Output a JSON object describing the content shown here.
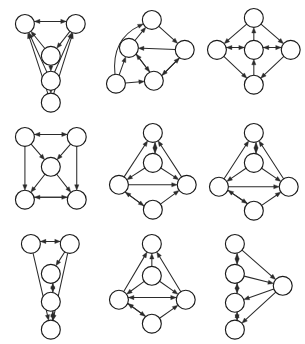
{
  "figure": {
    "panel_count": 9,
    "grid": {
      "rows": 3,
      "cols": 3
    },
    "node_count_per_panel": 5,
    "background_color": "#ffffff",
    "node_fill_color": "#ffffff",
    "node_stroke_color": "#1a1a1a",
    "edge_color": "#2b2b2b",
    "node_radius": 9.5,
    "arrowhead_length": 5.5,
    "arrowhead_width": 4.2
  },
  "panels": [
    {
      "id": "panel-1",
      "name": "wide-top-triangle-chain",
      "viewbox": [
        0,
        0,
        102,
        115
      ],
      "nodes": [
        {
          "id": "n0",
          "x": 25,
          "y": 24
        },
        {
          "id": "n1",
          "x": 76,
          "y": 24
        },
        {
          "id": "n2",
          "x": 51,
          "y": 56
        },
        {
          "id": "n3",
          "x": 51,
          "y": 81
        },
        {
          "id": "n4",
          "x": 51,
          "y": 103
        }
      ],
      "edges": [
        {
          "from": "n0",
          "to": "n1",
          "offset": -2.5
        },
        {
          "from": "n1",
          "to": "n0",
          "offset": 2.5
        },
        {
          "from": "n1",
          "to": "n2",
          "offset": 0
        },
        {
          "from": "n2",
          "to": "n0",
          "offset": 0
        },
        {
          "from": "n2",
          "to": "n3",
          "offset": 0
        },
        {
          "from": "n3",
          "to": "n0",
          "offset": 0
        },
        {
          "from": "n3",
          "to": "n1",
          "offset": 0
        },
        {
          "from": "n3",
          "to": "n4",
          "offset": 0
        },
        {
          "from": "n4",
          "to": "n0",
          "offset": 0
        },
        {
          "from": "n4",
          "to": "n1",
          "offset": 0
        }
      ]
    },
    {
      "id": "panel-2",
      "name": "curved-left-loop-cluster",
      "viewbox": [
        0,
        0,
        102,
        115
      ],
      "nodes": [
        {
          "id": "n0",
          "x": 50,
          "y": 20
        },
        {
          "id": "n1",
          "x": 27,
          "y": 48
        },
        {
          "id": "n2",
          "x": 83,
          "y": 50
        },
        {
          "id": "n3",
          "x": 14,
          "y": 84
        },
        {
          "id": "n4",
          "x": 52,
          "y": 81
        }
      ],
      "edges": [
        {
          "from": "n0",
          "to": "n2",
          "offset": 0
        },
        {
          "from": "n1",
          "to": "n0",
          "offset": 0
        },
        {
          "from": "n2",
          "to": "n1",
          "offset": 0
        },
        {
          "from": "n1",
          "to": "n4",
          "offset": -2.0
        },
        {
          "from": "n4",
          "to": "n1",
          "offset": 2.0
        },
        {
          "from": "n2",
          "to": "n4",
          "offset": -2.0
        },
        {
          "from": "n4",
          "to": "n2",
          "offset": 2.0
        },
        {
          "from": "n3",
          "to": "n1",
          "offset": 0
        },
        {
          "from": "n3",
          "to": "n4",
          "offset": 0
        }
      ],
      "curved_edges": [
        {
          "from": "n3",
          "to": "n0",
          "bow": -26
        }
      ]
    },
    {
      "id": "panel-3",
      "name": "diamond-with-hub",
      "viewbox": [
        0,
        0,
        102,
        115
      ],
      "nodes": [
        {
          "id": "n0",
          "x": 51,
          "y": 18
        },
        {
          "id": "n1",
          "x": 14,
          "y": 50
        },
        {
          "id": "n2",
          "x": 51,
          "y": 50
        },
        {
          "id": "n3",
          "x": 88,
          "y": 50
        },
        {
          "id": "n4",
          "x": 51,
          "y": 85
        }
      ],
      "edges": [
        {
          "from": "n0",
          "to": "n1",
          "offset": 0
        },
        {
          "from": "n0",
          "to": "n3",
          "offset": 0
        },
        {
          "from": "n2",
          "to": "n0",
          "offset": 0
        },
        {
          "from": "n1",
          "to": "n2",
          "offset": -2.3
        },
        {
          "from": "n2",
          "to": "n1",
          "offset": 2.3
        },
        {
          "from": "n2",
          "to": "n3",
          "offset": -2.3
        },
        {
          "from": "n3",
          "to": "n2",
          "offset": 2.3
        },
        {
          "from": "n4",
          "to": "n2",
          "offset": 0
        },
        {
          "from": "n1",
          "to": "n4",
          "offset": 0
        },
        {
          "from": "n3",
          "to": "n4",
          "offset": 0
        }
      ]
    },
    {
      "id": "panel-4",
      "name": "square-with-center",
      "viewbox": [
        0,
        0,
        102,
        110
      ],
      "nodes": [
        {
          "id": "n0",
          "x": 25,
          "y": 22
        },
        {
          "id": "n1",
          "x": 77,
          "y": 22
        },
        {
          "id": "n2",
          "x": 51,
          "y": 52
        },
        {
          "id": "n3",
          "x": 25,
          "y": 85
        },
        {
          "id": "n4",
          "x": 77,
          "y": 85
        }
      ],
      "edges": [
        {
          "from": "n0",
          "to": "n1",
          "offset": -2.5
        },
        {
          "from": "n1",
          "to": "n0",
          "offset": 2.5
        },
        {
          "from": "n0",
          "to": "n2",
          "offset": 0
        },
        {
          "from": "n1",
          "to": "n2",
          "offset": 0
        },
        {
          "from": "n0",
          "to": "n3",
          "offset": 0
        },
        {
          "from": "n1",
          "to": "n4",
          "offset": 0
        },
        {
          "from": "n2",
          "to": "n3",
          "offset": 0
        },
        {
          "from": "n2",
          "to": "n4",
          "offset": 0
        },
        {
          "from": "n3",
          "to": "n4",
          "offset": -2.5
        },
        {
          "from": "n4",
          "to": "n3",
          "offset": 2.5
        }
      ]
    },
    {
      "id": "panel-5",
      "name": "vertical-diamond-a",
      "viewbox": [
        0,
        0,
        102,
        110
      ],
      "nodes": [
        {
          "id": "n0",
          "x": 51,
          "y": 18
        },
        {
          "id": "n1",
          "x": 51,
          "y": 48
        },
        {
          "id": "n2",
          "x": 17,
          "y": 70
        },
        {
          "id": "n3",
          "x": 85,
          "y": 70
        },
        {
          "id": "n4",
          "x": 51,
          "y": 95
        }
      ],
      "edges": [
        {
          "from": "n0",
          "to": "n1",
          "offset": -2.2
        },
        {
          "from": "n1",
          "to": "n0",
          "offset": 2.2
        },
        {
          "from": "n2",
          "to": "n0",
          "offset": 0
        },
        {
          "from": "n3",
          "to": "n0",
          "offset": 0
        },
        {
          "from": "n1",
          "to": "n2",
          "offset": 0
        },
        {
          "from": "n1",
          "to": "n3",
          "offset": 0
        },
        {
          "from": "n2",
          "to": "n3",
          "offset": 0
        },
        {
          "from": "n4",
          "to": "n2",
          "offset": -2.2
        },
        {
          "from": "n2",
          "to": "n4",
          "offset": 2.2
        },
        {
          "from": "n4",
          "to": "n3",
          "offset": 0
        }
      ]
    },
    {
      "id": "panel-6",
      "name": "vertical-diamond-b",
      "viewbox": [
        0,
        0,
        102,
        110
      ],
      "nodes": [
        {
          "id": "n0",
          "x": 51,
          "y": 18
        },
        {
          "id": "n1",
          "x": 51,
          "y": 48
        },
        {
          "id": "n2",
          "x": 16,
          "y": 72
        },
        {
          "id": "n3",
          "x": 86,
          "y": 72
        },
        {
          "id": "n4",
          "x": 51,
          "y": 96
        }
      ],
      "edges": [
        {
          "from": "n0",
          "to": "n1",
          "offset": -2.2
        },
        {
          "from": "n1",
          "to": "n0",
          "offset": 2.2
        },
        {
          "from": "n2",
          "to": "n0",
          "offset": 0
        },
        {
          "from": "n3",
          "to": "n0",
          "offset": 0
        },
        {
          "from": "n1",
          "to": "n2",
          "offset": 0
        },
        {
          "from": "n1",
          "to": "n3",
          "offset": 0
        },
        {
          "from": "n2",
          "to": "n3",
          "offset": 0
        },
        {
          "from": "n2",
          "to": "n4",
          "offset": -2.2
        },
        {
          "from": "n4",
          "to": "n2",
          "offset": 2.2
        },
        {
          "from": "n4",
          "to": "n3",
          "offset": 0
        }
      ]
    },
    {
      "id": "panel-7",
      "name": "narrow-tapered-chain",
      "viewbox": [
        0,
        0,
        102,
        122
      ],
      "nodes": [
        {
          "id": "n0",
          "x": 31,
          "y": 20
        },
        {
          "id": "n1",
          "x": 70,
          "y": 20
        },
        {
          "id": "n2",
          "x": 51,
          "y": 50
        },
        {
          "id": "n3",
          "x": 51,
          "y": 78
        },
        {
          "id": "n4",
          "x": 51,
          "y": 106
        }
      ],
      "edges": [
        {
          "from": "n0",
          "to": "n1",
          "offset": -2.5
        },
        {
          "from": "n1",
          "to": "n0",
          "offset": 2.5
        },
        {
          "from": "n1",
          "to": "n2",
          "offset": 0
        },
        {
          "from": "n2",
          "to": "n3",
          "offset": -2.0
        },
        {
          "from": "n3",
          "to": "n2",
          "offset": 2.0
        },
        {
          "from": "n3",
          "to": "n4",
          "offset": -2.0
        },
        {
          "from": "n4",
          "to": "n3",
          "offset": 2.0
        },
        {
          "from": "n0",
          "to": "n4",
          "offset": 0
        },
        {
          "from": "n1",
          "to": "n4",
          "offset": 0
        }
      ]
    },
    {
      "id": "panel-8",
      "name": "diamond-center-hub",
      "viewbox": [
        0,
        0,
        102,
        122
      ],
      "nodes": [
        {
          "id": "n0",
          "x": 50,
          "y": 20
        },
        {
          "id": "n1",
          "x": 50,
          "y": 52
        },
        {
          "id": "n2",
          "x": 17,
          "y": 76
        },
        {
          "id": "n3",
          "x": 84,
          "y": 76
        },
        {
          "id": "n4",
          "x": 50,
          "y": 100
        }
      ],
      "edges": [
        {
          "from": "n1",
          "to": "n0",
          "offset": 0
        },
        {
          "from": "n2",
          "to": "n0",
          "offset": 0
        },
        {
          "from": "n3",
          "to": "n0",
          "offset": 0
        },
        {
          "from": "n1",
          "to": "n2",
          "offset": 0
        },
        {
          "from": "n1",
          "to": "n3",
          "offset": 0
        },
        {
          "from": "n2",
          "to": "n3",
          "offset": -2.2
        },
        {
          "from": "n3",
          "to": "n2",
          "offset": 2.2
        },
        {
          "from": "n2",
          "to": "n4",
          "offset": -2.2
        },
        {
          "from": "n4",
          "to": "n2",
          "offset": 2.2
        },
        {
          "from": "n4",
          "to": "n3",
          "offset": 0
        }
      ]
    },
    {
      "id": "panel-9",
      "name": "left-column-right-sink",
      "viewbox": [
        0,
        0,
        102,
        122
      ],
      "nodes": [
        {
          "id": "n0",
          "x": 32,
          "y": 20
        },
        {
          "id": "n1",
          "x": 32,
          "y": 50
        },
        {
          "id": "n2",
          "x": 32,
          "y": 79
        },
        {
          "id": "n3",
          "x": 32,
          "y": 106
        },
        {
          "id": "n4",
          "x": 80,
          "y": 62
        }
      ],
      "edges": [
        {
          "from": "n0",
          "to": "n1",
          "offset": -2.2
        },
        {
          "from": "n1",
          "to": "n0",
          "offset": 2.2
        },
        {
          "from": "n1",
          "to": "n2",
          "offset": -2.2
        },
        {
          "from": "n2",
          "to": "n1",
          "offset": 2.2
        },
        {
          "from": "n2",
          "to": "n3",
          "offset": -2.2
        },
        {
          "from": "n3",
          "to": "n2",
          "offset": 2.2
        },
        {
          "from": "n0",
          "to": "n4",
          "offset": 0
        },
        {
          "from": "n1",
          "to": "n4",
          "offset": 0
        },
        {
          "from": "n4",
          "to": "n2",
          "offset": 0
        },
        {
          "from": "n4",
          "to": "n3",
          "offset": 0
        }
      ]
    }
  ]
}
